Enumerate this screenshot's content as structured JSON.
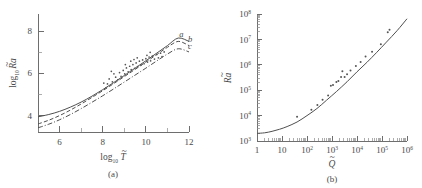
{
  "figure": {
    "background": "#ffffff",
    "ink": "#4a4a4a",
    "curve_color": "#4f4f4f",
    "point_color": "#555555"
  },
  "chart_data": [
    {
      "type": "line",
      "panel": "a",
      "caption": "(a)",
      "title": "",
      "xlabel": "log10 T~",
      "xlabel_parts": {
        "base": "log",
        "sub": "10",
        "var": "T",
        "accent": "tilde"
      },
      "ylabel": "log10 Ra~",
      "ylabel_parts": {
        "base": "log",
        "sub": "10",
        "var": "R",
        "var2": "a",
        "accent": "tilde"
      },
      "xlim": [
        5,
        12
      ],
      "ylim": [
        3.1,
        8.7
      ],
      "xticks": [
        6,
        8,
        10,
        12
      ],
      "xticklabels": [
        "6",
        "8",
        "10",
        "12"
      ],
      "xminorticks": [
        5,
        7,
        9,
        11
      ],
      "yticks": [
        4,
        6,
        8
      ],
      "yticklabels": [
        "4",
        "6",
        "8"
      ],
      "yminorticks": [
        5,
        7
      ],
      "grid": false,
      "legend_position": "inline-right",
      "series": [
        {
          "name": "a",
          "style": "solid",
          "label": "a",
          "label_x": 11.55,
          "label_y": 7.62,
          "x": [
            5.0,
            5.5,
            6.0,
            6.5,
            7.0,
            7.5,
            8.0,
            8.5,
            9.0,
            9.5,
            10.0,
            10.5,
            11.0,
            11.5,
            12.0
          ],
          "y": [
            3.82,
            3.93,
            4.08,
            4.28,
            4.52,
            4.8,
            5.11,
            5.44,
            5.78,
            6.13,
            6.48,
            6.84,
            7.2,
            7.56,
            7.4
          ]
        },
        {
          "name": "b",
          "style": "dashed",
          "label": "b",
          "label_x": 11.95,
          "label_y": 7.38,
          "x": [
            5.0,
            5.5,
            6.0,
            6.5,
            7.0,
            7.5,
            8.0,
            8.5,
            9.0,
            9.5,
            10.0,
            10.5,
            11.0,
            11.5,
            12.0
          ],
          "y": [
            3.48,
            3.66,
            3.88,
            4.14,
            4.43,
            4.74,
            5.06,
            5.39,
            5.73,
            6.07,
            6.42,
            6.77,
            7.12,
            7.4,
            7.2
          ]
        },
        {
          "name": "c",
          "style": "dashdot",
          "label": "c",
          "label_x": 11.95,
          "label_y": 7.02,
          "x": [
            5.0,
            5.5,
            6.0,
            6.5,
            7.0,
            7.5,
            8.0,
            8.5,
            9.0,
            9.5,
            10.0,
            10.5,
            11.0,
            11.5,
            12.0
          ],
          "y": [
            3.3,
            3.47,
            3.68,
            3.93,
            4.21,
            4.51,
            4.82,
            5.14,
            5.47,
            5.8,
            6.13,
            6.47,
            6.8,
            7.05,
            6.9
          ]
        }
      ],
      "scatter": {
        "name": "measurements",
        "marker": "dot",
        "points": [
          [
            8.05,
            5.42
          ],
          [
            8.22,
            5.38
          ],
          [
            8.3,
            5.62
          ],
          [
            8.45,
            5.48
          ],
          [
            8.52,
            5.86
          ],
          [
            8.6,
            5.7
          ],
          [
            8.7,
            5.58
          ],
          [
            8.78,
            5.92
          ],
          [
            8.85,
            5.74
          ],
          [
            8.95,
            6.02
          ],
          [
            9.02,
            5.86
          ],
          [
            9.1,
            6.14
          ],
          [
            9.18,
            5.96
          ],
          [
            9.25,
            6.22
          ],
          [
            9.32,
            6.06
          ],
          [
            9.4,
            6.3
          ],
          [
            9.48,
            6.12
          ],
          [
            9.55,
            6.38
          ],
          [
            9.62,
            6.2
          ],
          [
            9.7,
            6.46
          ],
          [
            9.78,
            6.28
          ],
          [
            9.85,
            6.52
          ],
          [
            9.92,
            6.34
          ],
          [
            10.0,
            6.58
          ],
          [
            10.08,
            6.42
          ],
          [
            10.15,
            6.66
          ],
          [
            10.22,
            6.48
          ],
          [
            10.3,
            6.7
          ],
          [
            10.4,
            6.56
          ],
          [
            10.5,
            6.78
          ],
          [
            10.58,
            6.62
          ],
          [
            10.68,
            6.84
          ],
          [
            10.75,
            6.68
          ],
          [
            10.85,
            6.9
          ],
          [
            9.05,
            6.3
          ],
          [
            9.3,
            6.46
          ],
          [
            9.6,
            6.62
          ],
          [
            8.4,
            5.98
          ],
          [
            8.15,
            5.2
          ],
          [
            10.2,
            6.88
          ],
          [
            10.05,
            6.74
          ],
          [
            9.45,
            6.54
          ]
        ]
      }
    },
    {
      "type": "line",
      "panel": "b",
      "caption": "(b)",
      "title": "",
      "xlabel": "Q~",
      "xlabel_parts": {
        "var": "Q",
        "accent": "tilde"
      },
      "ylabel": "Ra~",
      "ylabel_parts": {
        "var": "R",
        "var2": "a",
        "accent": "tilde"
      },
      "xscale": "log",
      "yscale": "log",
      "xlim": [
        1,
        1000000
      ],
      "ylim": [
        1000,
        100000000
      ],
      "xticklabels": [
        "1",
        "10",
        "10²",
        "10³",
        "10⁴",
        "10⁵",
        "10⁶"
      ],
      "xtick_exponents": [
        "",
        "",
        "2",
        "3",
        "4",
        "5",
        "6"
      ],
      "xtick_mantissas": [
        "1",
        "10",
        "10",
        "10",
        "10",
        "10",
        "10"
      ],
      "yticklabels": [
        "10³",
        "10⁴",
        "10⁵",
        "10⁶",
        "10⁷",
        "10⁸"
      ],
      "ytick_exponents": [
        "3",
        "4",
        "5",
        "6",
        "7",
        "8"
      ],
      "grid": false,
      "series": [
        {
          "name": "fit",
          "style": "solid",
          "x": [
            1,
            2,
            4,
            8,
            16,
            40,
            100,
            250,
            600,
            1500,
            4000,
            10000,
            25000,
            60000,
            150000,
            400000,
            1000000
          ],
          "y": [
            2000,
            2100,
            2400,
            2900,
            3700,
            5600,
            10000,
            19000,
            40000,
            88000,
            215000,
            530000,
            1250000,
            3000000,
            7800000,
            22000000.0,
            65000000.0
          ]
        }
      ],
      "scatter": {
        "name": "measurements",
        "marker": "dot",
        "points": [
          [
            40,
            9000
          ],
          [
            150,
            17000
          ],
          [
            260,
            26000
          ],
          [
            420,
            42000
          ],
          [
            700,
            62000
          ],
          [
            900,
            150000
          ],
          [
            1100,
            160000
          ],
          [
            1500,
            210000
          ],
          [
            1800,
            230000
          ],
          [
            2300,
            330000
          ],
          [
            2600,
            560000
          ],
          [
            3200,
            330000
          ],
          [
            4000,
            420000
          ],
          [
            5500,
            600000
          ],
          [
            9000,
            900000
          ],
          [
            14000,
            1300000
          ],
          [
            22000,
            2100000
          ],
          [
            40000,
            3300000
          ],
          [
            90000,
            6400000
          ],
          [
            170000,
            19000000
          ],
          [
            200000,
            24000000
          ]
        ]
      }
    }
  ]
}
